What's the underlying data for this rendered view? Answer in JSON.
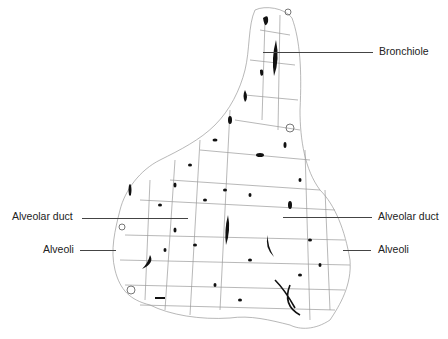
{
  "figure": {
    "labels": {
      "bronchiole": "Bronchiole",
      "alveolar_duct_left": "Alveolar duct",
      "alveoli_left": "Alveoli",
      "alveolar_duct_right": "Alveolar duct",
      "alveoli_right": "Alveoli"
    }
  }
}
